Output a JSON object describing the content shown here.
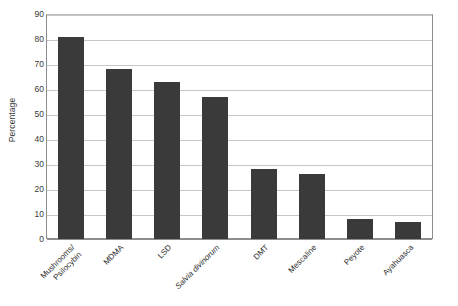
{
  "chart_data": {
    "type": "bar",
    "title": "",
    "xlabel": "",
    "ylabel": "Percentage",
    "ylim": [
      0,
      90
    ],
    "ytick_step": 10,
    "grid": true,
    "legend": "none",
    "bar_color": "#3a3a3a",
    "gridline_color": "#c6c6c6",
    "axis_color": "#8d8d8d",
    "categories": [
      "Mushrooms/\nPsilocybin",
      "MDMA",
      "LSD",
      "Salvia divinorum",
      "DMT",
      "Mescaline",
      "Peyote",
      "Ayahuasca"
    ],
    "category_styles": [
      "normal",
      "normal",
      "normal",
      "italic",
      "normal",
      "normal",
      "normal",
      "normal"
    ],
    "values": [
      81,
      68,
      63,
      57,
      28,
      26,
      8,
      7
    ],
    "yticks": [
      90,
      80,
      70,
      60,
      50,
      40,
      30,
      20,
      10,
      0
    ]
  }
}
